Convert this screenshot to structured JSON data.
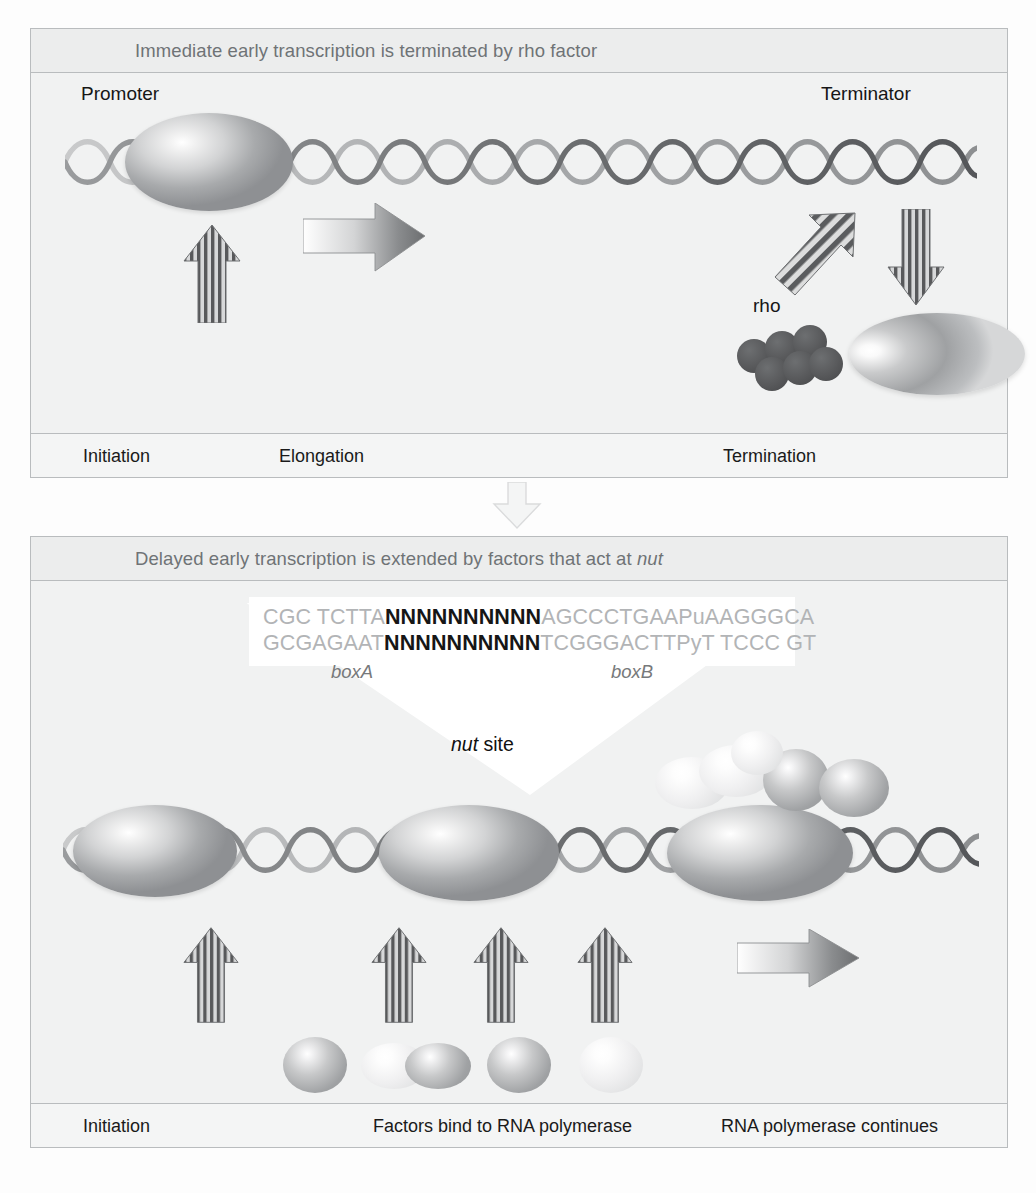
{
  "figure": {
    "background_color": "#fdfdfd",
    "panel_background": "#f1f2f2",
    "panel_border_color": "#b9bcbe",
    "title_text_color": "#6f7376",
    "body_text_color": "#161616"
  },
  "panel_top": {
    "title_prefix": "Immediate early transcription is terminated by rho factor",
    "labels": {
      "promoter": "Promoter",
      "terminator": "Terminator",
      "rho": "rho"
    },
    "footer": {
      "initiation": "Initiation",
      "elongation": "Elongation",
      "termination": "Termination"
    }
  },
  "panel_bottom": {
    "title_prefix": "Delayed early transcription is extended by factors that act at ",
    "title_italic": "nut",
    "sequence": {
      "top_prefix": "CGC TCTTA",
      "top_n": "NNNNNNNNNN",
      "top_suffix": "AGCCCTGAAPuAAGGGCA",
      "bottom_prefix": "GCGAGAAT",
      "bottom_n": "NNNNNNNNNN",
      "bottom_suffix": "TCGGGACTTPyT TCCC GT"
    },
    "box_labels": {
      "boxA": "boxA",
      "boxB": "boxB"
    },
    "nut_site": {
      "italic": "nut",
      "rest": " site"
    },
    "proteins": [
      {
        "name": "NusG",
        "style": "dark"
      },
      {
        "name": "NusB-S10",
        "style": "pair"
      },
      {
        "name": "NusA",
        "style": "dark"
      },
      {
        "name": "pN",
        "style": "pale"
      }
    ],
    "footer": {
      "initiation": "Initiation",
      "factors_bind": "Factors bind to RNA polymerase",
      "continues": "RNA polymerase continues"
    }
  },
  "icons": {
    "dna_helix": "dna-double-helix-icon",
    "polymerase": "rna-polymerase-ellipse-icon",
    "rho_hexamer": "rho-hexamer-icon",
    "up_arrow": "striped-up-arrow-icon",
    "right_arrow": "gradient-right-arrow-icon",
    "down_arrow": "striped-down-arrow-icon",
    "diagonal_arrow": "striped-diagonal-arrow-icon",
    "transition_arrow": "transition-down-arrow-icon"
  }
}
